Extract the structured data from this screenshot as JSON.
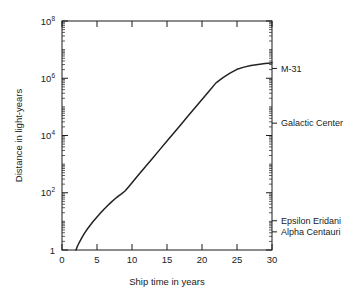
{
  "chart_data": {
    "type": "line",
    "title": "",
    "xlabel": "Ship time in years",
    "ylabel": "Distance in light-years",
    "xlim": [
      0,
      30
    ],
    "ylim": [
      1,
      100000000
    ],
    "yscale": "log",
    "xscale": "linear",
    "grid": false,
    "legend": "none",
    "xticks": [
      0,
      5,
      10,
      15,
      20,
      25,
      30
    ],
    "xticklabels": [
      "0",
      "5",
      "10",
      "15",
      "20",
      "25",
      "30"
    ],
    "yticks": [
      1,
      100,
      10000,
      1000000,
      100000000
    ],
    "yticklabels": [
      "1",
      "10",
      "10",
      "10",
      "10"
    ],
    "ytick_exponents": [
      "",
      "2",
      "4",
      "6",
      "8"
    ],
    "series": [
      {
        "name": "Relativistic starship distance",
        "x": [
          2.0,
          2.2,
          2.5,
          2.8,
          3.2,
          3.6,
          4.0,
          4.5,
          5.0,
          5.5,
          6.0,
          6.5,
          7.0,
          7.5,
          8.0,
          8.5,
          9.0,
          9.5,
          10.0,
          11.0,
          12.0,
          13.0,
          14.0,
          15.0,
          16.0,
          17.0,
          18.0,
          19.0,
          20.0,
          21.0,
          22.0,
          23.0,
          24.0,
          25.0,
          26.0,
          27.0,
          28.0,
          29.0,
          29.5,
          30.0
        ],
        "y": [
          1.0,
          1.35,
          1.9,
          2.6,
          3.8,
          5.3,
          7.2,
          10.3,
          14.3,
          19.5,
          26.5,
          35.0,
          46.0,
          59.0,
          75.0,
          92.0,
          115.0,
          160.0,
          225.0,
          440.0,
          860.0,
          1680.0,
          3280.0,
          6400.0,
          12500.0,
          24400.0,
          47600.0,
          93000.0,
          181000.0,
          354000.0,
          690000.0,
          1050000.0,
          1500000.0,
          2050000.0,
          2450000.0,
          2800000.0,
          3050000.0,
          3250000.0,
          3350000.0,
          3450000.0
        ]
      }
    ],
    "annotations": [
      {
        "label": "M-31",
        "y_value": 2200000
      },
      {
        "label": "Galactic Center",
        "y_value": 27000
      },
      {
        "label": "Epsilon Eridani",
        "y_value": 10.5
      },
      {
        "label": "Alpha Centauri",
        "y_value": 4.3
      }
    ]
  },
  "axes": {
    "x_title": "Ship time in years",
    "y_title": "Distance in light-years"
  },
  "colors": {
    "curve": "#222222",
    "axis": "#1a1a1a",
    "background": "#ffffff"
  }
}
